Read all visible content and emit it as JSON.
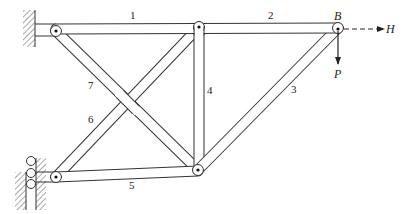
{
  "figure": {
    "type": "pin-jointed truss",
    "members": [
      {
        "id": "1",
        "label": "1",
        "from": "A_top",
        "to": "C_top"
      },
      {
        "id": "2",
        "label": "2",
        "from": "C_top",
        "to": "B"
      },
      {
        "id": "3",
        "label": "3",
        "from": "D_bottom",
        "to": "B"
      },
      {
        "id": "4",
        "label": "4",
        "from": "C_top",
        "to": "D_bottom"
      },
      {
        "id": "5",
        "label": "5",
        "from": "E_bottom_left",
        "to": "D_bottom"
      },
      {
        "id": "6",
        "label": "6",
        "from": "E_bottom_left",
        "to": "C_top"
      },
      {
        "id": "7",
        "label": "7",
        "from": "A_top",
        "to": "D_bottom"
      }
    ],
    "joints": [
      {
        "id": "A_top",
        "support": "fixed pin (wall)"
      },
      {
        "id": "E_bottom_left",
        "support": "roller (wall)"
      },
      {
        "id": "C_top"
      },
      {
        "id": "D_bottom"
      },
      {
        "id": "B",
        "label": "B"
      }
    ],
    "loads": {
      "horizontal": {
        "label": "H",
        "style": "dashed arrow, rightward"
      },
      "vertical": {
        "label": "P",
        "style": "solid arrow, downward"
      }
    },
    "labels": {
      "m1": "1",
      "m2": "2",
      "m3": "3",
      "m4": "4",
      "m5": "5",
      "m6": "6",
      "m7": "7",
      "joint_b": "B",
      "load_h": "H",
      "load_p": "P"
    }
  }
}
